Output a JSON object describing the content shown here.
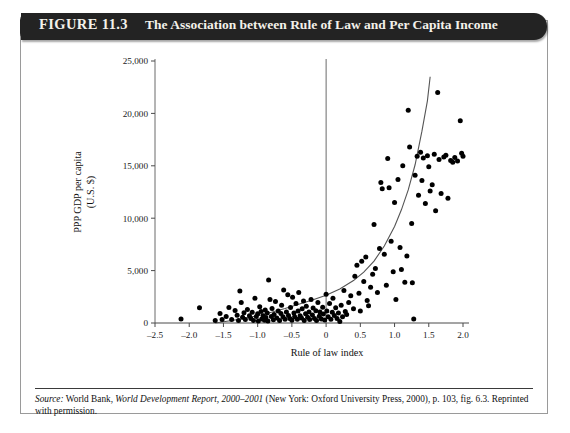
{
  "figure": {
    "number": "FIGURE 11.3",
    "title": "The Association between Rule of Law and Per Capita Income",
    "source_prefix": "Source:",
    "source_part1": " World Bank, ",
    "source_italic": "World Development Report, 2000–2001",
    "source_part2": " (New York: Oxford University Press, 2000), p. 103, fig. 6.3. Reprinted with permission."
  },
  "chart_data": {
    "type": "scatter",
    "title": "The Association between Rule of Law and Per Capita Income",
    "xlabel": "Rule of law index",
    "ylabel": "PPP GDP per capita (U.S. $)",
    "ylabel_line1": "PPP GDP per capita",
    "ylabel_line2": "(U.S. $)",
    "xlim": [
      -2.5,
      2.0
    ],
    "ylim": [
      0,
      25000
    ],
    "xticks": [
      -2.5,
      -2.0,
      -1.5,
      -1.0,
      -0.5,
      0,
      0.5,
      1.0,
      1.5,
      2.0
    ],
    "xticklabels": [
      "–2.5",
      "–2.0",
      "–1.5",
      "–1.0",
      "–0.5",
      "0",
      "0.5",
      "1.0",
      "1.5",
      "2.0"
    ],
    "yticks": [
      0,
      5000,
      10000,
      15000,
      20000,
      25000
    ],
    "yticklabels": [
      "0",
      "5,000",
      "10,000",
      "15,000",
      "20,000",
      "25,000"
    ],
    "grid": false,
    "legend": "none",
    "marker_color": "#000000",
    "curve_color": "#555555",
    "reference_line": {
      "orientation": "vertical",
      "x": 0,
      "color": "#6a6a6a"
    },
    "fit_curve": {
      "kind": "exponential",
      "note": "fitted exponential trend line rising from near zero at x≈-1.6 to ≈23,500 at x≈1.5",
      "points": [
        [
          -1.62,
          0
        ],
        [
          -1.4,
          220
        ],
        [
          -1.2,
          430
        ],
        [
          -1.0,
          700
        ],
        [
          -0.8,
          1020
        ],
        [
          -0.6,
          1380
        ],
        [
          -0.4,
          1790
        ],
        [
          -0.2,
          2200
        ],
        [
          0.0,
          2650
        ],
        [
          0.2,
          3250
        ],
        [
          0.4,
          4050
        ],
        [
          0.55,
          4850
        ],
        [
          0.7,
          5900
        ],
        [
          0.85,
          7350
        ],
        [
          1.0,
          9200
        ],
        [
          1.1,
          10800
        ],
        [
          1.2,
          12700
        ],
        [
          1.3,
          15100
        ],
        [
          1.4,
          18300
        ],
        [
          1.48,
          21200
        ],
        [
          1.52,
          23500
        ]
      ]
    },
    "points": [
      [
        -2.12,
        380
      ],
      [
        -1.85,
        1450
      ],
      [
        -1.62,
        230
      ],
      [
        -1.55,
        900
      ],
      [
        -1.52,
        330
      ],
      [
        -1.46,
        620
      ],
      [
        -1.42,
        1480
      ],
      [
        -1.38,
        330
      ],
      [
        -1.33,
        1200
      ],
      [
        -1.3,
        740
      ],
      [
        -1.28,
        250
      ],
      [
        -1.26,
        3050
      ],
      [
        -1.24,
        1950
      ],
      [
        -1.22,
        560
      ],
      [
        -1.2,
        980
      ],
      [
        -1.18,
        330
      ],
      [
        -1.15,
        1300
      ],
      [
        -1.12,
        680
      ],
      [
        -1.1,
        420
      ],
      [
        -1.08,
        1020
      ],
      [
        -1.06,
        250
      ],
      [
        -1.04,
        2350
      ],
      [
        -1.02,
        630
      ],
      [
        -1.0,
        880
      ],
      [
        -0.99,
        200
      ],
      [
        -0.97,
        1550
      ],
      [
        -0.95,
        1100
      ],
      [
        -0.94,
        380
      ],
      [
        -0.92,
        700
      ],
      [
        -0.9,
        260
      ],
      [
        -0.89,
        1250
      ],
      [
        -0.88,
        520
      ],
      [
        -0.86,
        950
      ],
      [
        -0.85,
        180
      ],
      [
        -0.84,
        4100
      ],
      [
        -0.82,
        2250
      ],
      [
        -0.8,
        620
      ],
      [
        -0.79,
        1380
      ],
      [
        -0.77,
        300
      ],
      [
        -0.76,
        820
      ],
      [
        -0.74,
        2050
      ],
      [
        -0.72,
        480
      ],
      [
        -0.7,
        1150
      ],
      [
        -0.68,
        230
      ],
      [
        -0.66,
        900
      ],
      [
        -0.65,
        1700
      ],
      [
        -0.63,
        600
      ],
      [
        -0.62,
        3150
      ],
      [
        -0.6,
        350
      ],
      [
        -0.58,
        1050
      ],
      [
        -0.56,
        2700
      ],
      [
        -0.55,
        720
      ],
      [
        -0.53,
        420
      ],
      [
        -0.52,
        1480
      ],
      [
        -0.5,
        260
      ],
      [
        -0.49,
        2450
      ],
      [
        -0.47,
        950
      ],
      [
        -0.46,
        600
      ],
      [
        -0.44,
        1850
      ],
      [
        -0.42,
        350
      ],
      [
        -0.41,
        1150
      ],
      [
        -0.4,
        2900
      ],
      [
        -0.38,
        700
      ],
      [
        -0.36,
        480
      ],
      [
        -0.35,
        1350
      ],
      [
        -0.33,
        2100
      ],
      [
        -0.32,
        250
      ],
      [
        -0.3,
        880
      ],
      [
        -0.29,
        1600
      ],
      [
        -0.27,
        560
      ],
      [
        -0.25,
        1050
      ],
      [
        -0.24,
        330
      ],
      [
        -0.22,
        2250
      ],
      [
        -0.2,
        760
      ],
      [
        -0.19,
        1420
      ],
      [
        -0.17,
        430
      ],
      [
        -0.15,
        1180
      ],
      [
        -0.14,
        250
      ],
      [
        -0.12,
        1950
      ],
      [
        -0.1,
        650
      ],
      [
        -0.09,
        1050
      ],
      [
        -0.07,
        380
      ],
      [
        -0.05,
        1500
      ],
      [
        -0.04,
        850
      ],
      [
        -0.02,
        280
      ],
      [
        0.0,
        2750
      ],
      [
        0.01,
        1150
      ],
      [
        0.03,
        600
      ],
      [
        0.05,
        1850
      ],
      [
        0.07,
        350
      ],
      [
        0.09,
        1020
      ],
      [
        0.1,
        2350
      ],
      [
        0.12,
        720
      ],
      [
        0.14,
        1450
      ],
      [
        0.16,
        430
      ],
      [
        0.18,
        950
      ],
      [
        0.2,
        150
      ],
      [
        0.22,
        1700
      ],
      [
        0.24,
        600
      ],
      [
        0.26,
        3100
      ],
      [
        0.28,
        1100
      ],
      [
        0.3,
        820
      ],
      [
        0.33,
        1950
      ],
      [
        0.36,
        2600
      ],
      [
        0.4,
        1350
      ],
      [
        0.42,
        4450
      ],
      [
        0.45,
        5500
      ],
      [
        0.48,
        2850
      ],
      [
        0.5,
        1150
      ],
      [
        0.52,
        5900
      ],
      [
        0.55,
        3950
      ],
      [
        0.58,
        6300
      ],
      [
        0.6,
        2150
      ],
      [
        0.62,
        1650
      ],
      [
        0.65,
        3400
      ],
      [
        0.68,
        4650
      ],
      [
        0.7,
        9400
      ],
      [
        0.72,
        5200
      ],
      [
        0.75,
        2900
      ],
      [
        0.78,
        7100
      ],
      [
        0.8,
        13400
      ],
      [
        0.82,
        12800
      ],
      [
        0.85,
        6550
      ],
      [
        0.88,
        3600
      ],
      [
        0.9,
        15700
      ],
      [
        0.92,
        12900
      ],
      [
        0.95,
        7800
      ],
      [
        0.98,
        4900
      ],
      [
        1.0,
        11500
      ],
      [
        1.02,
        2250
      ],
      [
        1.05,
        13700
      ],
      [
        1.08,
        7200
      ],
      [
        1.1,
        5100
      ],
      [
        1.12,
        15000
      ],
      [
        1.15,
        3900
      ],
      [
        1.18,
        6400
      ],
      [
        1.2,
        20300
      ],
      [
        1.22,
        16800
      ],
      [
        1.25,
        9500
      ],
      [
        1.26,
        3850
      ],
      [
        1.28,
        390
      ],
      [
        1.3,
        14100
      ],
      [
        1.33,
        15900
      ],
      [
        1.35,
        12200
      ],
      [
        1.38,
        16300
      ],
      [
        1.4,
        13600
      ],
      [
        1.42,
        15750
      ],
      [
        1.45,
        11400
      ],
      [
        1.48,
        15950
      ],
      [
        1.5,
        14900
      ],
      [
        1.52,
        12600
      ],
      [
        1.55,
        13200
      ],
      [
        1.58,
        16100
      ],
      [
        1.6,
        10700
      ],
      [
        1.63,
        22000
      ],
      [
        1.65,
        15600
      ],
      [
        1.68,
        12350
      ],
      [
        1.72,
        15850
      ],
      [
        1.75,
        16000
      ],
      [
        1.78,
        11900
      ],
      [
        1.82,
        15500
      ],
      [
        1.85,
        15350
      ],
      [
        1.88,
        15800
      ],
      [
        1.92,
        15450
      ],
      [
        1.96,
        19300
      ],
      [
        1.98,
        16200
      ],
      [
        2.0,
        15900
      ]
    ]
  }
}
